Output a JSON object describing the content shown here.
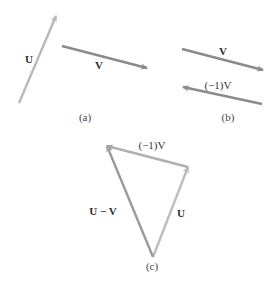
{
  "colors": {
    "u_vector": "#b9b9b9",
    "v_vector": "#8a8a8a",
    "neg_v_vector": "#8a8a8a",
    "c_neg_v": "#b0b0b0",
    "c_u_minus_v": "#9a9a9a",
    "c_u": "#bdbdbd",
    "text": "#333333"
  },
  "panels": {
    "a": {
      "caption": "(a)",
      "vectors": [
        {
          "name": "U",
          "label": "U",
          "from": [
            19,
            103
          ],
          "to": [
            56,
            16
          ]
        },
        {
          "name": "V",
          "label": "V",
          "from": [
            62,
            46
          ],
          "to": [
            147,
            68
          ]
        }
      ]
    },
    "b": {
      "caption": "(b)",
      "vectors": [
        {
          "name": "V",
          "label": "V",
          "from": [
            182,
            49
          ],
          "to": [
            263,
            70
          ]
        },
        {
          "name": "neg-V",
          "label": "(−1)V",
          "from": [
            262,
            104
          ],
          "to": [
            183,
            87
          ]
        }
      ]
    },
    "c": {
      "caption": "(c)",
      "vectors": [
        {
          "name": "U",
          "label": "U",
          "from": [
            153,
            257
          ],
          "to": [
            188,
            167
          ]
        },
        {
          "name": "neg-V",
          "label": "(−1)V",
          "from": [
            188,
            167
          ],
          "to": [
            107,
            146
          ]
        },
        {
          "name": "U-minus-V",
          "label": "U − V",
          "from": [
            153,
            257
          ],
          "to": [
            107,
            146
          ]
        }
      ]
    }
  }
}
